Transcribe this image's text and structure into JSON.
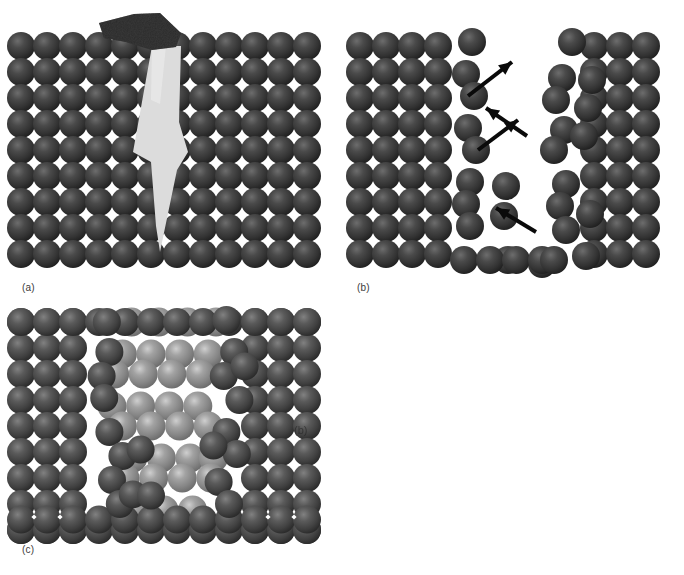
{
  "figure": {
    "width": 684,
    "height": 575,
    "background": "#ffffff"
  },
  "colors": {
    "matrix_sphere_dark": "#3a3a3a",
    "matrix_sphere_dark_edge": "#252525",
    "matrix_sphere_dark_highlight": "#6a6a6a",
    "matrix_sphere_mid": "#4a4a4a",
    "matrix_sphere_mid_highlight": "#7a7a7a",
    "healing_sphere_light": "#8d8d8d",
    "healing_sphere_light_highlight": "#c2c2c2",
    "crack_fill": "#dcdcdc",
    "indenter_fill": "#2a2a2a",
    "arrow_color": "#0a0a0a",
    "label_color": "#3b3b3b",
    "gap_color": "#ffffff"
  },
  "lattice": {
    "sphere_diameter": 28,
    "pitch_x": 26,
    "pitch_y": 26,
    "gap_marker": "white-diamond"
  },
  "panels": [
    {
      "id": "a",
      "label": "(a)",
      "label_x": 22,
      "label_y": 288,
      "caption_meaning": "Indenter loads the surface and nucleates a zigzag crack into the lattice",
      "origin_x": 21,
      "origin_y": 46,
      "columns": 12,
      "rows": 9,
      "features": [
        "indenter-tip",
        "zigzag-crack",
        "full-lattice"
      ]
    },
    {
      "id": "b",
      "label": "(b)",
      "label_x": 357,
      "label_y": 288,
      "caption_meaning": "Crack opens into a wide void; arrows mark the displacement of the separated blocks",
      "origin_x": 360,
      "origin_y": 46,
      "columns": 12,
      "rows": 9,
      "features": [
        "left-block",
        "right-block",
        "open-void",
        "displacement-arrows"
      ],
      "arrow_count": 4
    },
    {
      "id": "c",
      "label": "(c)",
      "label_x": 22,
      "label_y": 550,
      "caption_meaning": "Void is refilled by lighter healing-phase atoms, restoring continuity",
      "origin_x": 21,
      "origin_y": 312,
      "columns": 12,
      "rows": 9,
      "features": [
        "matrix-lattice",
        "healing-phase-spheres",
        "ghost-label-artifact"
      ],
      "ghost_label": {
        "text": "(b)",
        "x": 294,
        "y": 431
      }
    }
  ],
  "icons": {
    "indenter": "indenter-tip-icon",
    "crack": "crack-wedge-icon",
    "arrow": "displacement-arrow-icon",
    "sphere": "atom-sphere-icon"
  },
  "chart_data": {
    "type": "diagram",
    "panels": [
      {
        "id": "a",
        "label": "(a)",
        "description": "Indentation nucleates a zigzag crack",
        "lattice_columns": 12,
        "lattice_rows": 9,
        "sphere_color": "#3a3a3a",
        "crack_color": "#dcdcdc",
        "crack_path_points": [
          [
            163,
            46
          ],
          [
            180,
            46
          ],
          [
            178,
            120
          ],
          [
            186,
            150
          ],
          [
            176,
            168
          ],
          [
            160,
            250
          ],
          [
            155,
            225
          ],
          [
            150,
            160
          ],
          [
            133,
            150
          ],
          [
            152,
            100
          ]
        ],
        "indenter_polygon": [
          [
            100,
            22
          ],
          [
            158,
            14
          ],
          [
            178,
            36
          ],
          [
            172,
            47
          ],
          [
            150,
            49
          ],
          [
            120,
            40
          ],
          [
            100,
            36
          ]
        ]
      },
      {
        "id": "b",
        "label": "(b)",
        "description": "Crack opens into a void; blocks displace along arrows",
        "lattice_columns": 12,
        "lattice_rows": 9,
        "left_block_columns": 4,
        "right_block_columns": 4,
        "void_color": "#ffffff",
        "arrows": [
          {
            "x1": 468,
            "y1": 96,
            "x2": 512,
            "y2": 62,
            "angle_deg": 38
          },
          {
            "x1": 527,
            "y1": 136,
            "x2": 486,
            "y2": 108,
            "angle_deg": 34
          },
          {
            "x1": 478,
            "y1": 150,
            "x2": 518,
            "y2": 120,
            "angle_deg": 37
          },
          {
            "x1": 536,
            "y1": 232,
            "x2": 496,
            "y2": 208,
            "angle_deg": 31
          }
        ]
      },
      {
        "id": "c",
        "label": "(c)",
        "description": "Void refilled by a lighter healing phase",
        "lattice_columns": 12,
        "lattice_rows": 9,
        "matrix_color": "#4a4a4a",
        "healing_phase_color": "#8d8d8d",
        "healing_sphere_count": 34
      }
    ]
  }
}
